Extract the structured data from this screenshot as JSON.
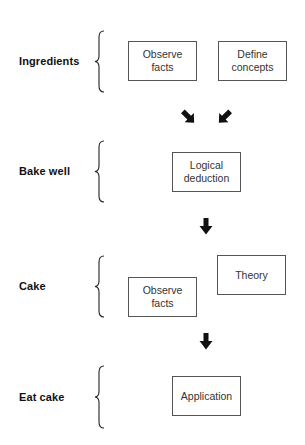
{
  "diagram": {
    "stages": [
      {
        "label": "Ingredients",
        "boxes": [
          {
            "text": "Observe\nfacts"
          },
          {
            "text": "Define\nconcepts"
          }
        ]
      },
      {
        "label": "Bake well",
        "boxes": [
          {
            "text": "Logical\ndeduction"
          }
        ]
      },
      {
        "label": "Cake",
        "boxes": [
          {
            "text": "Theory"
          },
          {
            "text": "Observe\nfacts"
          }
        ]
      },
      {
        "label": "Eat cake",
        "boxes": [
          {
            "text": "Application"
          }
        ]
      }
    ],
    "arrows": [
      {
        "direction": "down-right",
        "icon": "arrow-down-right-icon"
      },
      {
        "direction": "down-left",
        "icon": "arrow-down-left-icon"
      },
      {
        "direction": "down",
        "icon": "arrow-down-icon"
      },
      {
        "direction": "down",
        "icon": "arrow-down-icon"
      }
    ],
    "colors": {
      "text": "#111111",
      "box_border": "#555555",
      "arrow": "#111111"
    }
  }
}
